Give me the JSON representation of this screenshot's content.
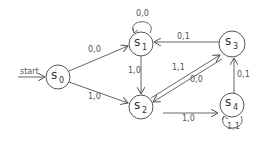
{
  "diagram": {
    "type": "finite-state-machine",
    "start_label": "start",
    "states": [
      {
        "id": "s0",
        "letter": "s",
        "sub": "0",
        "x": 58,
        "y": 77
      },
      {
        "id": "s1",
        "letter": "s",
        "sub": "1",
        "x": 141,
        "y": 44
      },
      {
        "id": "s2",
        "letter": "s",
        "sub": "2",
        "x": 141,
        "y": 107
      },
      {
        "id": "s3",
        "letter": "s",
        "sub": "3",
        "x": 232,
        "y": 44
      },
      {
        "id": "s4",
        "letter": "s",
        "sub": "4",
        "x": 232,
        "y": 105
      }
    ],
    "transitions": [
      {
        "from": "s0",
        "to": "s1",
        "label": "0,0"
      },
      {
        "from": "s0",
        "to": "s2",
        "label": "1,0"
      },
      {
        "from": "s1",
        "to": "s1",
        "label": "0,0"
      },
      {
        "from": "s1",
        "to": "s2",
        "label": "1,0"
      },
      {
        "from": "s3",
        "to": "s1",
        "label": "0,1"
      },
      {
        "from": "s2",
        "to": "s3",
        "label": "1,1"
      },
      {
        "from": "s3",
        "to": "s2",
        "label": "0,0"
      },
      {
        "from": "s2",
        "to": "s4",
        "label": "1,0"
      },
      {
        "from": "s4",
        "to": "s3",
        "label": "0,1"
      },
      {
        "from": "s4",
        "to": "s4",
        "label": "1,1"
      }
    ]
  }
}
